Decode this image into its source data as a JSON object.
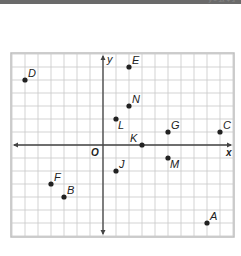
{
  "caption": "y = 3x + 3",
  "grid": {
    "x_min": -7,
    "x_max": 10,
    "y_min": -7,
    "y_max": 7,
    "origin_px": [
      103,
      145
    ],
    "cell_px": 13
  },
  "axes": {
    "x_label": "x",
    "y_label": "y",
    "origin_label": "O"
  },
  "colors": {
    "grid": "#c8c8c8",
    "axis": "#444444",
    "point": "#222222",
    "frame": "#bdbdbd"
  },
  "points": [
    {
      "label": "D",
      "x": -6,
      "y": 5,
      "dx": 3,
      "dy": -3
    },
    {
      "label": "E",
      "x": 2,
      "y": 6,
      "dx": 3,
      "dy": -3
    },
    {
      "label": "N",
      "x": 2,
      "y": 3,
      "dx": 3,
      "dy": -3
    },
    {
      "label": "L",
      "x": 1,
      "y": 2,
      "dx": 2,
      "dy": 10
    },
    {
      "label": "G",
      "x": 5,
      "y": 1,
      "dx": 3,
      "dy": -3
    },
    {
      "label": "C",
      "x": 9,
      "y": 1,
      "dx": 3,
      "dy": -3
    },
    {
      "label": "K",
      "x": 3,
      "y": 0,
      "dx": -12,
      "dy": -3
    },
    {
      "label": "M",
      "x": 5,
      "y": -1,
      "dx": 2,
      "dy": 10
    },
    {
      "label": "J",
      "x": 1,
      "y": -2,
      "dx": 3,
      "dy": -3
    },
    {
      "label": "F",
      "x": -4,
      "y": -3,
      "dx": 3,
      "dy": -3
    },
    {
      "label": "B",
      "x": -3,
      "y": -4,
      "dx": 3,
      "dy": -3
    },
    {
      "label": "A",
      "x": 8,
      "y": -6,
      "dx": 3,
      "dy": -3
    }
  ]
}
